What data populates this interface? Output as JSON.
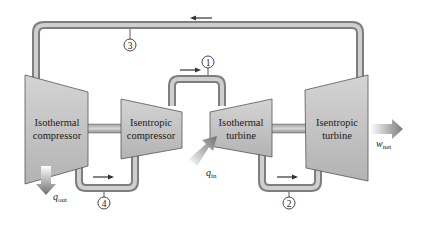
{
  "diagram": {
    "components": [
      {
        "id": "isothermal-compressor",
        "label_line1": "Isothermal",
        "label_line2": "compressor"
      },
      {
        "id": "isentropic-compressor",
        "label_line1": "Isentropic",
        "label_line2": "compressor"
      },
      {
        "id": "isothermal-turbine",
        "label_line1": "Isothermal",
        "label_line2": "turbine"
      },
      {
        "id": "isentropic-turbine",
        "label_line1": "Isentropic",
        "label_line2": "turbine"
      }
    ],
    "states": [
      "1",
      "2",
      "3",
      "4"
    ],
    "heat_in": {
      "symbol": "q",
      "subscript": "in"
    },
    "heat_out": {
      "symbol": "q",
      "subscript": "out"
    },
    "work_net": {
      "symbol": "w",
      "subscript": "net"
    },
    "flow_arrow_glyph": "→",
    "colors": {
      "pipe_outer": "#8c8c8c",
      "pipe_inner": "#c8c8c8",
      "body_fill": "#c4c4c4",
      "body_stroke": "#555555",
      "arrow_gray": "#777777"
    }
  }
}
